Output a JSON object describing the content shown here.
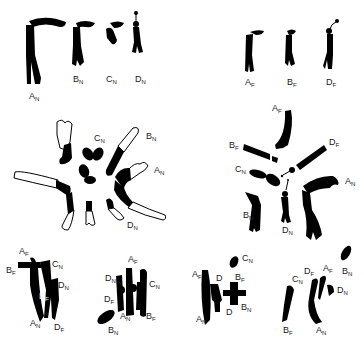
{
  "figure": {
    "panels": [
      {
        "id": "top-left",
        "title": "",
        "labels": [
          {
            "base": "A",
            "sub": "N"
          },
          {
            "base": "B",
            "sub": "N"
          },
          {
            "base": "C",
            "sub": "N"
          },
          {
            "base": "D",
            "sub": "N"
          }
        ]
      },
      {
        "id": "top-right",
        "title": "",
        "labels": [
          {
            "base": "A",
            "sub": "F"
          },
          {
            "base": "B",
            "sub": "F"
          },
          {
            "base": "D",
            "sub": "F"
          }
        ]
      },
      {
        "id": "middle-left",
        "title": "",
        "labels": [
          {
            "base": "C",
            "sub": "N"
          },
          {
            "base": "B",
            "sub": "N"
          },
          {
            "base": "A",
            "sub": "N"
          },
          {
            "base": "D",
            "sub": "N"
          }
        ]
      },
      {
        "id": "middle-right",
        "title": "",
        "labels": [
          {
            "base": "A",
            "sub": "F"
          },
          {
            "base": "B",
            "sub": "F"
          },
          {
            "base": "D",
            "sub": "F"
          },
          {
            "base": "C",
            "sub": "N"
          },
          {
            "base": "A",
            "sub": "N"
          },
          {
            "base": "B",
            "sub": "N"
          },
          {
            "base": "D",
            "sub": "N"
          }
        ]
      },
      {
        "id": "bottom-1",
        "title": "",
        "labels": [
          {
            "base": "A",
            "sub": "F"
          },
          {
            "base": "B",
            "sub": "F"
          },
          {
            "base": "C",
            "sub": "N"
          },
          {
            "base": "D",
            "sub": "N"
          },
          {
            "base": "B",
            "sub": "F"
          },
          {
            "base": "A",
            "sub": "N"
          },
          {
            "base": "D",
            "sub": "F"
          }
        ]
      },
      {
        "id": "bottom-2",
        "title": "",
        "labels": [
          {
            "base": "D",
            "sub": "N"
          },
          {
            "base": "A",
            "sub": "F"
          },
          {
            "base": "C",
            "sub": "N"
          },
          {
            "base": "D",
            "sub": "F"
          },
          {
            "base": "A",
            "sub": "N"
          },
          {
            "base": "B",
            "sub": "F"
          },
          {
            "base": "B",
            "sub": "N"
          }
        ]
      },
      {
        "id": "bottom-3",
        "title": "",
        "labels": [
          {
            "base": "A",
            "sub": "F"
          },
          {
            "base": "D",
            "sub": ""
          },
          {
            "base": "C",
            "sub": "N"
          },
          {
            "base": "B",
            "sub": "F"
          },
          {
            "base": "B",
            "sub": "N"
          },
          {
            "base": "D",
            "sub": ""
          },
          {
            "base": "A",
            "sub": "N"
          }
        ]
      },
      {
        "id": "bottom-4",
        "title": "",
        "labels": [
          {
            "base": "C",
            "sub": "N"
          },
          {
            "base": "D",
            "sub": "F"
          },
          {
            "base": "A",
            "sub": "F"
          },
          {
            "base": "B",
            "sub": "N"
          },
          {
            "base": "D",
            "sub": "N"
          },
          {
            "base": "B",
            "sub": "F"
          },
          {
            "base": "A",
            "sub": "N"
          }
        ]
      }
    ]
  }
}
